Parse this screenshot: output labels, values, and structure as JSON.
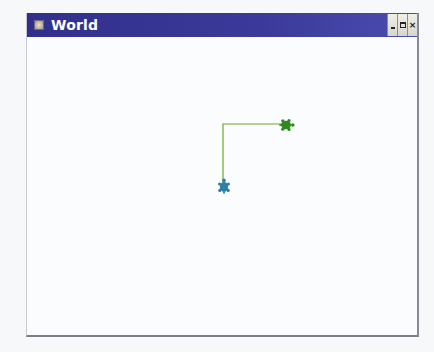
{
  "window": {
    "title": "World",
    "icon": "app-window-icon",
    "controls": {
      "minimize": "minimize",
      "maximize": "maximize",
      "close": "close",
      "close_glyph": "×"
    }
  },
  "colors": {
    "titlebar": "#3a3a98",
    "title_text": "#ffffff",
    "canvas_bg": "#fbfcfd",
    "trail_line": "#6aa830",
    "turtle_green": "#2e8a1e",
    "turtle_blue": "#2f7fa6"
  },
  "world": {
    "trail": [
      {
        "x": 196,
        "y": 149
      },
      {
        "x": 196,
        "y": 87
      },
      {
        "x": 257,
        "y": 87
      }
    ],
    "turtles": [
      {
        "name": "green-turtle",
        "x": 259,
        "y": 88,
        "heading": "east",
        "color": "#2e8a1e"
      },
      {
        "name": "blue-turtle",
        "x": 197,
        "y": 150,
        "heading": "north",
        "color": "#2f7fa6"
      }
    ]
  }
}
